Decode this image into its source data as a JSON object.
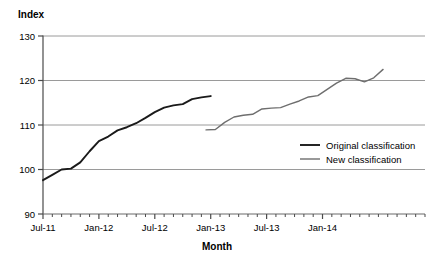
{
  "chart_data": {
    "type": "line",
    "title": "",
    "xlabel": "Month",
    "ylabel": "Index",
    "ylim": [
      90,
      130
    ],
    "yticks": [
      90,
      100,
      110,
      120,
      130
    ],
    "ytick_labels": [
      "90",
      "100",
      "110",
      "120",
      "130"
    ],
    "grid": "horizontal",
    "xlim": [
      "Jul-11",
      "Dec-14"
    ],
    "xtick_labels": [
      "Jul-11",
      "Jan-12",
      "Jul-12",
      "Jan-13",
      "Jul-13",
      "Jan-14"
    ],
    "xtick_positions": [
      0,
      6,
      12,
      18,
      24,
      30
    ],
    "minor_tick_interval_months": 1,
    "legend_position": "center-right",
    "series": [
      {
        "name": "Original classification",
        "color": "#1a1a1a",
        "x": [
          0,
          1,
          2,
          3,
          4,
          5,
          6,
          7,
          8,
          9,
          10,
          11,
          12,
          13,
          14,
          15,
          16,
          17,
          18
        ],
        "values": [
          97.6,
          98.8,
          100.0,
          100.2,
          101.6,
          104.1,
          106.4,
          107.4,
          108.8,
          109.5,
          110.4,
          111.6,
          112.9,
          113.9,
          114.4,
          114.7,
          115.8,
          116.2,
          116.5
        ]
      },
      {
        "name": "New classification",
        "color": "#6e6e6e",
        "x": [
          17.5,
          18.5,
          19.5,
          20.5,
          21.5,
          22.5,
          23.5,
          24.5,
          25.5,
          26.5,
          27.5,
          28.5,
          29.5,
          30.5,
          31.5,
          32.5,
          33.5,
          34.5,
          35.5,
          36.5
        ],
        "values": [
          108.9,
          109.0,
          110.6,
          111.8,
          112.2,
          112.4,
          113.6,
          113.8,
          113.9,
          114.7,
          115.4,
          116.3,
          116.6,
          118.0,
          119.4,
          120.5,
          120.4,
          119.7,
          120.6,
          122.5
        ]
      }
    ]
  },
  "axes": {
    "y_title": "Index",
    "x_title": "Month"
  },
  "legend": {
    "items": [
      {
        "label": "Original classification",
        "color": "#1a1a1a"
      },
      {
        "label": "New classification",
        "color": "#6e6e6e"
      }
    ]
  }
}
